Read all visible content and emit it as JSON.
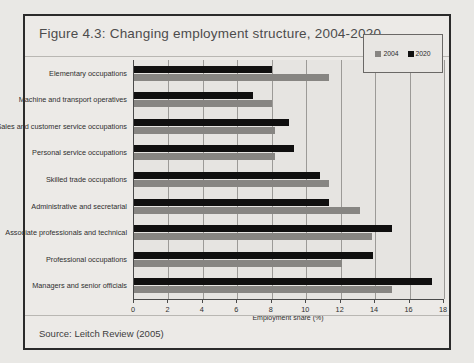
{
  "figure": {
    "title": "Figure 4.3: Changing employment structure, 2004-2020",
    "source": "Source: Leitch Review (2005)"
  },
  "legend": {
    "items": [
      {
        "label": "2004",
        "color": "#878582"
      },
      {
        "label": "2020",
        "color": "#111111"
      }
    ]
  },
  "chart_data": {
    "type": "bar",
    "orientation": "horizontal",
    "title": "Figure 4.3: Changing employment structure, 2004-2020",
    "xlabel": "Employment share (%)",
    "ylabel": "",
    "xlim": [
      0,
      18
    ],
    "xticks": [
      0,
      2,
      4,
      6,
      8,
      10,
      12,
      14,
      16,
      18
    ],
    "grid": true,
    "legend_position": "top-right",
    "categories": [
      "Elementary occupations",
      "Machine and transport operatives",
      "Sales and customer service occupations",
      "Personal service occupations",
      "Skilled trade occupations",
      "Administrative and secretarial",
      "Associate professionals and technical",
      "Professional occupations",
      "Managers and senior officials"
    ],
    "series": [
      {
        "name": "2004",
        "color": "#878582",
        "values": [
          11.3,
          8.0,
          8.2,
          8.2,
          11.3,
          13.1,
          13.8,
          12.1,
          15.0
        ]
      },
      {
        "name": "2020",
        "color": "#111111",
        "values": [
          8.0,
          6.9,
          9.0,
          9.3,
          10.8,
          11.3,
          15.0,
          13.9,
          17.3
        ]
      }
    ]
  }
}
